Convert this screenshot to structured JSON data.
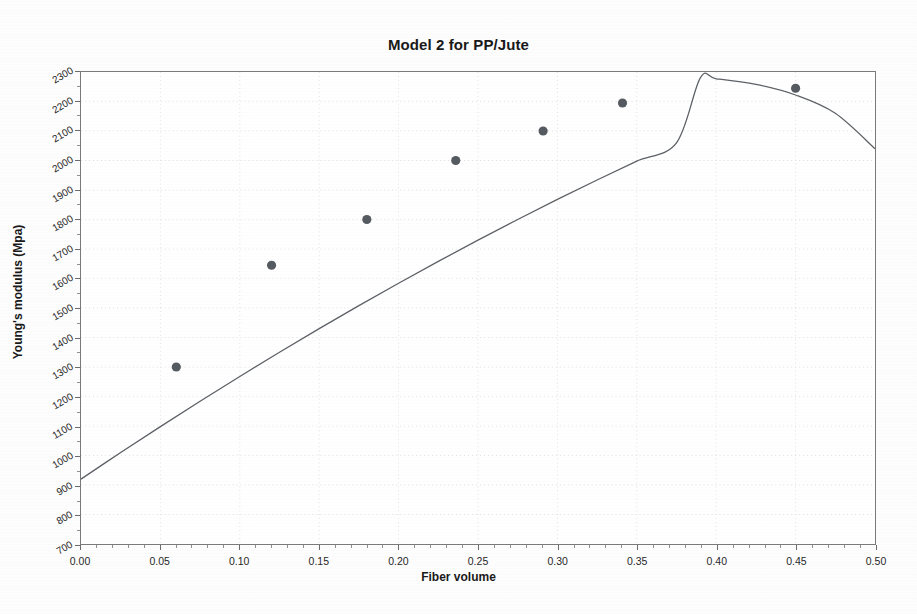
{
  "chart_data": {
    "type": "scatter",
    "title": "Model 2 for PP/Jute",
    "xlabel": "Fiber volume",
    "ylabel": "Young's modulus (Mpa)",
    "xlim": [
      0.0,
      0.5
    ],
    "ylim": [
      700,
      2300
    ],
    "grid": true,
    "legend": "none",
    "x_ticks": [
      "0.00",
      "0.05",
      "0.10",
      "0.15",
      "0.20",
      "0.25",
      "0.30",
      "0.35",
      "0.40",
      "0.45",
      "0.50"
    ],
    "x_tick_values": [
      0.0,
      0.05,
      0.1,
      0.15,
      0.2,
      0.25,
      0.3,
      0.35,
      0.4,
      0.45,
      0.5
    ],
    "y_ticks": [
      "700",
      "800",
      "900",
      "1000",
      "1100",
      "1200",
      "1300",
      "1400",
      "1500",
      "1600",
      "1700",
      "1800",
      "1900",
      "2000",
      "2100",
      "2200",
      "2300"
    ],
    "y_tick_values": [
      700,
      800,
      900,
      1000,
      1100,
      1200,
      1300,
      1400,
      1500,
      1600,
      1700,
      1800,
      1900,
      2000,
      2100,
      2200,
      2300
    ],
    "series": [
      {
        "name": "Experimental data",
        "kind": "scatter",
        "marker": "circle",
        "color": "#555a60",
        "points": [
          {
            "x": 0.06,
            "y": 1300
          },
          {
            "x": 0.12,
            "y": 1645
          },
          {
            "x": 0.18,
            "y": 1800
          },
          {
            "x": 0.236,
            "y": 2000
          },
          {
            "x": 0.291,
            "y": 2100
          },
          {
            "x": 0.341,
            "y": 2195
          },
          {
            "x": 0.45,
            "y": 2245
          }
        ]
      },
      {
        "name": "Model 2 fit",
        "kind": "line",
        "color": "#5d6166",
        "curve": [
          {
            "x": 0.0,
            "y": 920
          },
          {
            "x": 0.025,
            "y": 1010
          },
          {
            "x": 0.05,
            "y": 1098
          },
          {
            "x": 0.075,
            "y": 1184
          },
          {
            "x": 0.1,
            "y": 1268
          },
          {
            "x": 0.125,
            "y": 1350
          },
          {
            "x": 0.15,
            "y": 1430
          },
          {
            "x": 0.175,
            "y": 1508
          },
          {
            "x": 0.2,
            "y": 1584
          },
          {
            "x": 0.225,
            "y": 1658
          },
          {
            "x": 0.25,
            "y": 1730
          },
          {
            "x": 0.275,
            "y": 1800
          },
          {
            "x": 0.3,
            "y": 1868
          },
          {
            "x": 0.325,
            "y": 1934
          },
          {
            "x": 0.35,
            "y": 1998
          },
          {
            "x": 0.375,
            "y": 2060
          },
          {
            "x": 0.39,
            "y": 2280
          },
          {
            "x": 0.4,
            "y": 2277
          },
          {
            "x": 0.425,
            "y": 2258
          },
          {
            "x": 0.45,
            "y": 2222
          },
          {
            "x": 0.475,
            "y": 2160
          },
          {
            "x": 0.5,
            "y": 2040
          }
        ]
      }
    ]
  },
  "figure": {
    "background_color": "#fdfdfd",
    "plot_background_color": "#ffffff",
    "frame_color": "#7a7a7a",
    "grid_color": "#e2e2e2",
    "marker_color": "#555a60",
    "line_color": "#5d6166",
    "text_color": "#191919"
  }
}
